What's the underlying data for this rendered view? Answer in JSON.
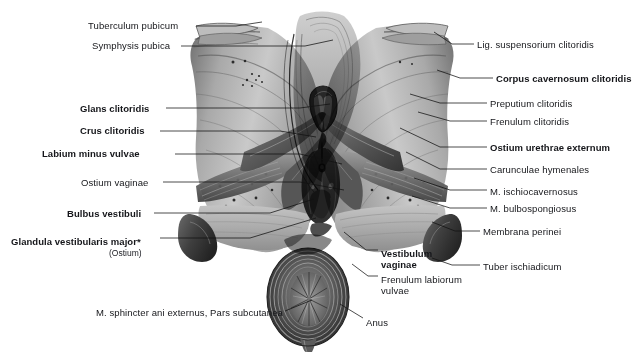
{
  "figure": {
    "footnote_marker": "*"
  },
  "labels_left": [
    {
      "id": "tuberculum-pubicum",
      "text": "Tuberculum pubicum",
      "bold": false,
      "x": 88,
      "y": 20
    },
    {
      "id": "symphysis-pubica",
      "text": "Symphysis pubica",
      "bold": false,
      "x": 92,
      "y": 40
    },
    {
      "id": "glans-clitoridis",
      "text": "Glans clitoridis",
      "bold": true,
      "x": 80,
      "y": 103
    },
    {
      "id": "crus-clitoridis",
      "text": "Crus clitoridis",
      "bold": true,
      "x": 80,
      "y": 125
    },
    {
      "id": "labium-minus-vulvae",
      "text": "Labium minus vulvae",
      "bold": true,
      "x": 42,
      "y": 148
    },
    {
      "id": "ostium-vaginae",
      "text": "Ostium vaginae",
      "bold": false,
      "x": 81,
      "y": 177
    },
    {
      "id": "bulbus-vestibuli",
      "text": "Bulbus vestibuli",
      "bold": true,
      "x": 67,
      "y": 208
    },
    {
      "id": "glandula-vestibularis-major",
      "text": "Glandula vestibularis major*",
      "bold": true,
      "x": 11,
      "y": 236
    },
    {
      "id": "m-sphincter-ani-externus",
      "text": "M. sphincter ani externus, Pars subcutanea",
      "bold": false,
      "x": 96,
      "y": 307
    }
  ],
  "labels_left_sub": [
    {
      "id": "ostium-sub",
      "text": "(Ostium)",
      "x": 109,
      "y": 248
    }
  ],
  "labels_right": [
    {
      "id": "lig-suspensorium-clitoridis",
      "text": "Lig. suspensorium clitoridis",
      "bold": false,
      "x": 477,
      "y": 39
    },
    {
      "id": "corpus-cavernosum-clitoridis",
      "text": "Corpus cavernosum clitoridis",
      "bold": true,
      "x": 496,
      "y": 73
    },
    {
      "id": "preputium-clitoridis",
      "text": "Preputium clitoridis",
      "bold": false,
      "x": 490,
      "y": 98
    },
    {
      "id": "frenulum-clitoridis",
      "text": "Frenulum clitoridis",
      "bold": false,
      "x": 490,
      "y": 116
    },
    {
      "id": "ostium-urethrae-externum",
      "text": "Ostium urethrae externum",
      "bold": true,
      "x": 490,
      "y": 142
    },
    {
      "id": "carunculae-hymenales",
      "text": "Carunculae hymenales",
      "bold": false,
      "x": 490,
      "y": 164
    },
    {
      "id": "m-ischiocavernosus",
      "text": "M. ischiocavernosus",
      "bold": false,
      "x": 490,
      "y": 186
    },
    {
      "id": "m-bulbospongiosus",
      "text": "M. bulbospongiosus",
      "bold": false,
      "x": 490,
      "y": 203
    },
    {
      "id": "membrana-perinei",
      "text": "Membrana perinei",
      "bold": false,
      "x": 483,
      "y": 226
    },
    {
      "id": "tuber-ischiadicum",
      "text": "Tuber ischiadicum",
      "bold": false,
      "x": 483,
      "y": 261
    }
  ],
  "labels_center": [
    {
      "id": "vestibulum-vaginae-1",
      "text": "Vestibulum",
      "bold": true,
      "x": 381,
      "y": 248
    },
    {
      "id": "vestibulum-vaginae-2",
      "text": "vaginae",
      "bold": true,
      "x": 381,
      "y": 259
    },
    {
      "id": "frenulum-labiorum-1",
      "text": "Frenulum labiorum",
      "bold": false,
      "x": 381,
      "y": 274
    },
    {
      "id": "frenulum-labiorum-2",
      "text": "vulvae",
      "bold": false,
      "x": 381,
      "y": 285
    },
    {
      "id": "anus",
      "text": "Anus",
      "bold": false,
      "x": 366,
      "y": 317
    }
  ],
  "leaders": {
    "stroke": "#111111",
    "width": 0.75,
    "paths": [
      {
        "id": "leader-tuberculum-pubicum",
        "points": "196,26 236,26 262,22"
      },
      {
        "id": "leader-symphysis-pubica",
        "points": "181,46 305,46 333,40"
      },
      {
        "id": "leader-glans-clitoridis",
        "points": "166,108 300,108 330,104"
      },
      {
        "id": "leader-crus-clitoridis",
        "points": "160,131 280,131 316,137"
      },
      {
        "id": "leader-labium-minus-vulvae",
        "points": "175,154 300,154 342,164"
      },
      {
        "id": "leader-ostium-vaginae",
        "points": "163,182 300,182 344,190"
      },
      {
        "id": "leader-bulbus-vestibuli",
        "points": "154,213 270,213 314,199"
      },
      {
        "id": "leader-glandula-vest-major",
        "points": "160,238 250,238 316,218"
      },
      {
        "id": "leader-m-sphincter-ani",
        "points": "285,311 312,300"
      },
      {
        "id": "leader-lig-suspensorium",
        "points": "474,44 452,44 434,32"
      },
      {
        "id": "leader-corpus-cavernosum",
        "points": "493,78 460,78 437,70"
      },
      {
        "id": "leader-preputium",
        "points": "487,103 440,103 410,94"
      },
      {
        "id": "leader-frenulum-clitoridis",
        "points": "487,121 450,121 418,112"
      },
      {
        "id": "leader-ostium-urethrae",
        "points": "487,147 440,147 400,128"
      },
      {
        "id": "leader-carunculae",
        "points": "487,169 440,169 406,152"
      },
      {
        "id": "leader-m-ischiocavernosus",
        "points": "487,190 450,190 414,178"
      },
      {
        "id": "leader-m-bulbospongiosus",
        "points": "487,208 450,208 412,196"
      },
      {
        "id": "leader-membrana-perinei",
        "points": "480,231 455,231 432,222"
      },
      {
        "id": "leader-tuber-ischiadicum",
        "points": "480,265 452,265 432,258"
      },
      {
        "id": "leader-vestibulum-vaginae",
        "points": "378,250 366,250 344,232"
      },
      {
        "id": "leader-frenulum-labiorum",
        "points": "378,276 368,276 352,264"
      },
      {
        "id": "leader-anus",
        "points": "363,318 340,304"
      }
    ]
  }
}
